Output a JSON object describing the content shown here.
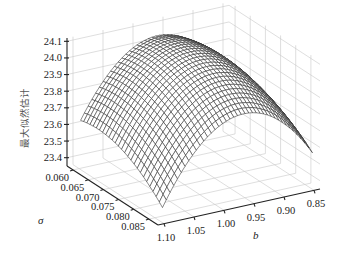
{
  "chart_data": {
    "type": "surface3d",
    "title": "",
    "xlabel": "b",
    "ylabel": "σ",
    "zlabel": "最大似然估计",
    "x_ticks": [
      "0.85",
      "0.90",
      "0.95",
      "1.00",
      "1.05",
      "1.10"
    ],
    "y_ticks": [
      "0.060",
      "0.065",
      "0.070",
      "0.075",
      "0.080",
      "0.085"
    ],
    "z_ticks": [
      "23.4",
      "23.5",
      "23.6",
      "23.7",
      "23.8",
      "23.9",
      "24.0",
      "24.1"
    ],
    "xlim": [
      0.84,
      1.11
    ],
    "ylim": [
      0.058,
      0.088
    ],
    "zlim": [
      23.35,
      24.12
    ],
    "grid": true,
    "surface": {
      "description": "Concave dome-shaped wireframe mesh with peak near b≈0.97, σ≈0.068 at ≈24.08; falls to ≈23.35 at corners",
      "peak": {
        "b": 0.97,
        "sigma": 0.068,
        "z": 24.08
      },
      "corner_values": {
        "b0.85_s0.060": 23.45,
        "b1.10_s0.060": 23.35,
        "b0.85_s0.088": 23.55,
        "b1.10_s0.088": 23.4
      }
    }
  },
  "labels": {
    "x_axis": "b",
    "y_axis": "σ",
    "z_axis": "最大似然估计"
  }
}
